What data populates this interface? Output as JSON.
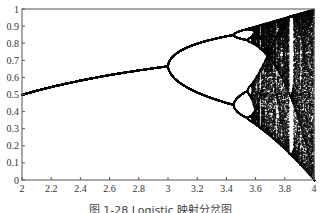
{
  "caption": "图 1-28  Logistic 映射分岔图",
  "chart_data": {
    "type": "scatter",
    "title": "",
    "xlabel": "",
    "ylabel": "",
    "x_ticks": [
      "2",
      "2.2",
      "2.4",
      "2.6",
      "2.8",
      "3",
      "3.2",
      "3.4",
      "3.6",
      "3.8",
      "4"
    ],
    "y_ticks": [
      "0",
      "0.1",
      "0.2",
      "0.3",
      "0.4",
      "0.5",
      "0.6",
      "0.7",
      "0.8",
      "0.9",
      "1"
    ],
    "xlim": [
      2,
      4
    ],
    "ylim": [
      0,
      1
    ],
    "grid": false,
    "legend": null,
    "r_samples": 700,
    "transient_iterations": 300,
    "plotted_iterations": 120,
    "x0": 0.5,
    "features": {
      "fixed_point_at_r2": 0.5,
      "first_bifurcation_r": 3.0,
      "period2_branch_at_r3_35": [
        0.45,
        0.83
      ],
      "second_bifurcation_r": 3.449,
      "chaos_onset_r": 3.57,
      "period3_window_r": 3.83,
      "range_at_r4": [
        0,
        1
      ]
    },
    "point_color": "#111111"
  },
  "plot_area": {
    "left": 22,
    "top": 9,
    "right": 314,
    "bottom": 180
  }
}
